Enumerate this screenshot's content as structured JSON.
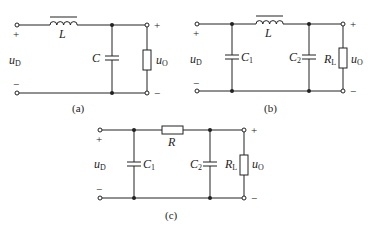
{
  "figure": {
    "panels": [
      {
        "id": "a",
        "caption": "(a)",
        "input_label": {
          "main": "u",
          "sub": "D"
        },
        "output_label": {
          "main": "u",
          "sub": "O"
        },
        "components": [
          {
            "type": "inductor",
            "label": "L"
          },
          {
            "type": "capacitor",
            "label": "C"
          },
          {
            "type": "resistor",
            "label": ""
          }
        ]
      },
      {
        "id": "b",
        "caption": "(b)",
        "input_label": {
          "main": "u",
          "sub": "D"
        },
        "output_label": {
          "main": "u",
          "sub": "O"
        },
        "components": [
          {
            "type": "capacitor",
            "label": "C",
            "sub": "1"
          },
          {
            "type": "inductor",
            "label": "L"
          },
          {
            "type": "capacitor",
            "label": "C",
            "sub": "2"
          },
          {
            "type": "resistor",
            "label": "R",
            "sub": "L"
          }
        ]
      },
      {
        "id": "c",
        "caption": "(c)",
        "input_label": {
          "main": "u",
          "sub": "D"
        },
        "output_label": {
          "main": "u",
          "sub": "O"
        },
        "components": [
          {
            "type": "capacitor",
            "label": "C",
            "sub": "1"
          },
          {
            "type": "resistor",
            "label": "R"
          },
          {
            "type": "capacitor",
            "label": "C",
            "sub": "2"
          },
          {
            "type": "resistor",
            "label": "R",
            "sub": "L"
          }
        ]
      }
    ],
    "polarity": {
      "plus": "+",
      "minus": "−"
    }
  }
}
